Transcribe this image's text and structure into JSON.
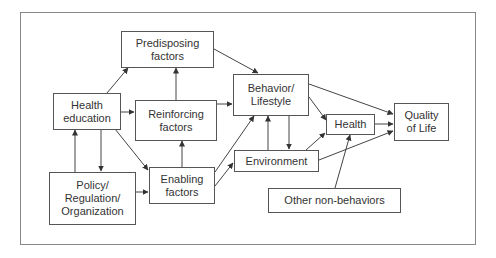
{
  "diagram": {
    "title": "",
    "nodes": {
      "health_education": {
        "label": "Health\neducation"
      },
      "predisposing": {
        "label": "Predisposing\nfactors"
      },
      "reinforcing": {
        "label": "Reinforcing\nfactors"
      },
      "enabling": {
        "label": "Enabling\nfactors"
      },
      "policy": {
        "label": "Policy/\nRegulation/\nOrganization"
      },
      "behavior": {
        "label": "Behavior/\nLifestyle"
      },
      "environment": {
        "label": "Environment"
      },
      "health": {
        "label": "Health"
      },
      "quality_of_life": {
        "label": "Quality\nof Life"
      },
      "other_non_behaviors": {
        "label": "Other non-behaviors"
      }
    },
    "edges": [
      {
        "from": "Health education",
        "to": "Predisposing factors"
      },
      {
        "from": "Health education",
        "to": "Reinforcing factors"
      },
      {
        "from": "Health education",
        "to": "Enabling factors"
      },
      {
        "from": "Health education",
        "to": "Policy/Regulation/Organization"
      },
      {
        "from": "Policy/Regulation/Organization",
        "to": "Health education"
      },
      {
        "from": "Policy/Regulation/Organization",
        "to": "Enabling factors"
      },
      {
        "from": "Reinforcing factors",
        "to": "Predisposing factors"
      },
      {
        "from": "Enabling factors",
        "to": "Reinforcing factors"
      },
      {
        "from": "Predisposing factors",
        "to": "Behavior/Lifestyle"
      },
      {
        "from": "Reinforcing factors",
        "to": "Behavior/Lifestyle"
      },
      {
        "from": "Enabling factors",
        "to": "Behavior/Lifestyle"
      },
      {
        "from": "Enabling factors",
        "to": "Environment"
      },
      {
        "from": "Behavior/Lifestyle",
        "to": "Environment"
      },
      {
        "from": "Environment",
        "to": "Behavior/Lifestyle"
      },
      {
        "from": "Behavior/Lifestyle",
        "to": "Health"
      },
      {
        "from": "Behavior/Lifestyle",
        "to": "Quality of Life"
      },
      {
        "from": "Environment",
        "to": "Health"
      },
      {
        "from": "Environment",
        "to": "Quality of Life"
      },
      {
        "from": "Health",
        "to": "Quality of Life"
      },
      {
        "from": "Other non-behaviors",
        "to": "Health"
      }
    ]
  },
  "colors": {
    "line": "#444444",
    "box_border": "#555555",
    "frame": "#888888",
    "text": "#333333"
  }
}
